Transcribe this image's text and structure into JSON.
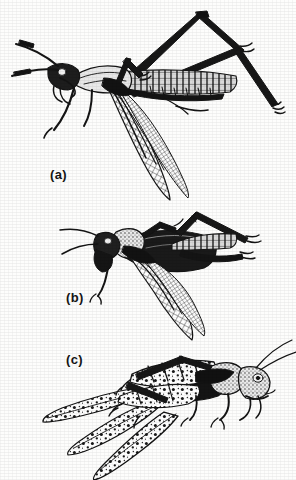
{
  "plate": {
    "kind": "scanned-book-illustration",
    "medium": "black-and-white line engraving",
    "background_color": "#fdfdfc",
    "ink_color": "#161616",
    "width_px": 296,
    "height_px": 480,
    "figures": [
      {
        "id": "a",
        "label": "(a)",
        "subject": "long-horned grasshopper (katydid) in lateral view, facing left",
        "label_x": 50,
        "label_y": 167,
        "features": [
          "two very long filiform antennae sweeping up-left",
          "slender elongate body with segmented abdomen extending right",
          "large cross-hatched folded wing hanging down below the body",
          "one hind leg raised high with femur apex near the top edge",
          "second hind leg extending down-right to a tarsus at lower right"
        ]
      },
      {
        "id": "b",
        "label": "(b)",
        "subject": "short-horned grasshopper in lateral view, facing left",
        "label_x": 66,
        "label_y": 290,
        "features": [
          "rounded head with short antennae pointing left",
          "bulbous pronotum behind the head",
          "hatched wings angled down and to the right",
          "two hind legs stretched backward to the right",
          "foreleg hanging down below the head"
        ]
      },
      {
        "id": "c",
        "label": "(c)",
        "subject": "migratory locust in lateral view, facing right",
        "label_x": 66,
        "label_y": 352,
        "features": [
          "two long antennae sweeping up and to the right",
          "pale granulate head and pronotum",
          "mottled, spotted tegmina and hind wings spread down-left",
          "stout hind femur with dark chevron markings",
          "hind tibia folded sharply upward at the knee"
        ]
      }
    ]
  }
}
